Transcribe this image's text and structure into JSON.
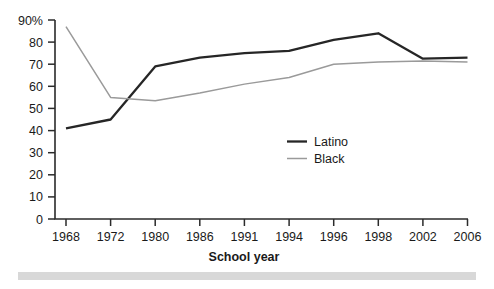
{
  "chart_data": {
    "type": "line",
    "title": "",
    "xlabel": "School year",
    "ylabel": "",
    "categories": [
      "1968",
      "1972",
      "1980",
      "1986",
      "1991",
      "1994",
      "1996",
      "1998",
      "2002",
      "2006"
    ],
    "series": [
      {
        "name": "Latino",
        "color": "#262626",
        "values": [
          41,
          45,
          69,
          73,
          75,
          76,
          81,
          84,
          72.5,
          73
        ]
      },
      {
        "name": "Black",
        "color": "#9a9a9a",
        "values": [
          87,
          55,
          53.5,
          57,
          61,
          64,
          70,
          71,
          71.5,
          71
        ]
      }
    ],
    "ylim": [
      0,
      90
    ],
    "ytick_labels": [
      "0",
      "10",
      "20",
      "30",
      "40",
      "50",
      "60",
      "70",
      "80",
      "90%"
    ],
    "ytick_values": [
      0,
      10,
      20,
      30,
      40,
      50,
      60,
      70,
      80,
      90
    ],
    "grid": false,
    "legend_position": "inside-center-right"
  },
  "axis": {
    "x_title": "School year"
  },
  "legend": {
    "entries": [
      {
        "label": "Latino"
      },
      {
        "label": "Black"
      }
    ]
  },
  "colors": {
    "latino": "#262626",
    "black_series": "#9a9a9a",
    "axis": "#2b2b2b",
    "text": "#1a1a1a",
    "footer_bar": "#d8d8d8",
    "background": "#ffffff"
  }
}
